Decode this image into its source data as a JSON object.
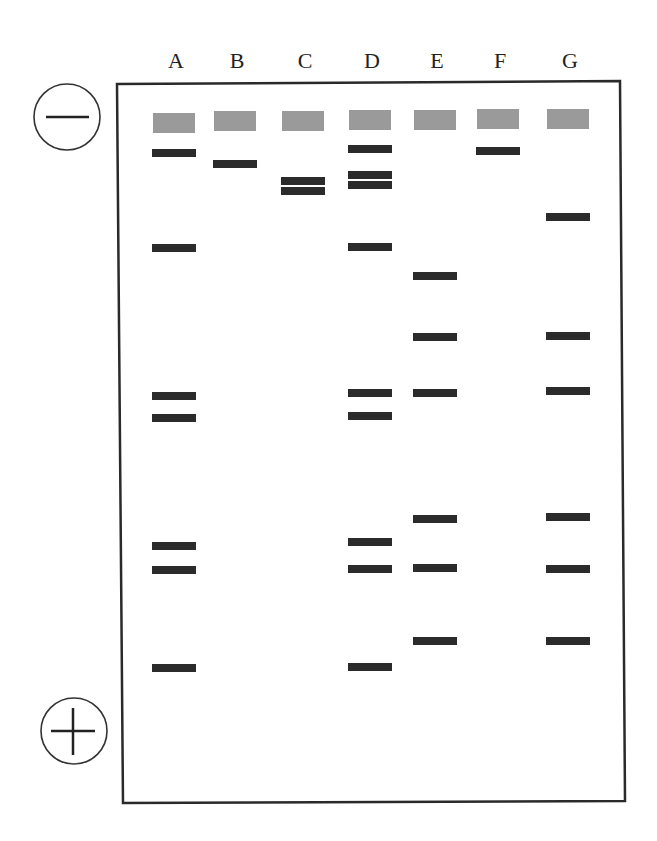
{
  "electrodes": {
    "negative": {
      "symbol": "minus",
      "label": "−"
    },
    "positive": {
      "symbol": "plus",
      "label": "+"
    }
  },
  "colors": {
    "frame": "#2a2a2a",
    "well": "#9a9a9a",
    "band": "#2b2b2b",
    "label": "#222222"
  },
  "lanes": [
    {
      "label": "A",
      "x": 174,
      "well_y": 113,
      "bands_y": [
        153,
        248,
        396,
        418,
        546,
        570,
        668
      ]
    },
    {
      "label": "B",
      "x": 235,
      "well_y": 111,
      "bands_y": [
        164
      ]
    },
    {
      "label": "C",
      "x": 303,
      "well_y": 111,
      "bands_y": [
        181,
        191
      ]
    },
    {
      "label": "D",
      "x": 370,
      "well_y": 110,
      "bands_y": [
        149,
        175,
        185,
        247,
        393,
        416,
        542,
        569,
        667
      ]
    },
    {
      "label": "E",
      "x": 435,
      "well_y": 110,
      "bands_y": [
        276,
        337,
        393,
        519,
        568,
        641
      ]
    },
    {
      "label": "F",
      "x": 498,
      "well_y": 109,
      "bands_y": [
        151
      ]
    },
    {
      "label": "G",
      "x": 568,
      "well_y": 109,
      "bands_y": [
        217,
        336,
        391,
        517,
        569,
        641
      ]
    }
  ],
  "chart_data": {
    "type": "diagram",
    "title": "",
    "lane_labels": [
      "A",
      "B",
      "C",
      "D",
      "E",
      "F",
      "G"
    ],
    "band_counts": {
      "A": 7,
      "B": 1,
      "C": 2,
      "D": 9,
      "E": 6,
      "F": 1,
      "G": 6
    },
    "band_positions_px": {
      "A": [
        153,
        248,
        396,
        418,
        546,
        570,
        668
      ],
      "B": [
        164
      ],
      "C": [
        181,
        191
      ],
      "D": [
        149,
        175,
        185,
        247,
        393,
        416,
        542,
        569,
        667
      ],
      "E": [
        276,
        337,
        393,
        519,
        568,
        641
      ],
      "F": [
        151
      ],
      "G": [
        217,
        336,
        391,
        517,
        569,
        641
      ]
    },
    "annotations": [
      "negative electrode (−) at top",
      "positive electrode (+) at bottom"
    ]
  }
}
